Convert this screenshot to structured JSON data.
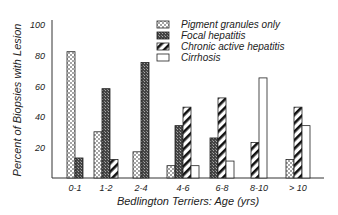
{
  "chart_data": {
    "type": "bar",
    "title": "",
    "xlabel": "Bedlington Terriers: Age (yrs)",
    "ylabel": "Percent of Biopsies with Lesion",
    "ylim": [
      0,
      100
    ],
    "yticks": [
      20,
      40,
      60,
      80,
      100
    ],
    "grid": false,
    "legend_position": "upper right",
    "categories": [
      "0-1",
      "1-2",
      "2-4",
      "4-6",
      "6-8",
      "8-10",
      "> 10"
    ],
    "series": [
      {
        "name": "Pigment granules only",
        "pattern": "dots",
        "values": [
          82,
          30,
          17,
          8,
          0,
          0,
          12
        ]
      },
      {
        "name": "Focal hepatitis",
        "pattern": "dense-crosshatch",
        "values": [
          13,
          58,
          75,
          34,
          26,
          0,
          0
        ]
      },
      {
        "name": "Chronic active hepatitis",
        "pattern": "diagonal-stripes",
        "values": [
          0,
          12,
          0,
          46,
          52,
          23,
          46
        ]
      },
      {
        "name": "Cirrhosis",
        "pattern": "white",
        "values": [
          0,
          0,
          0,
          8,
          11,
          65,
          34
        ]
      }
    ]
  }
}
